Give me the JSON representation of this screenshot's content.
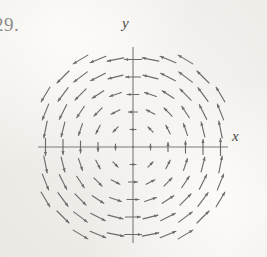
{
  "figure": {
    "problem_number": "29.",
    "axis_labels": {
      "x": "x",
      "y": "y"
    },
    "ink_color": "#6b6b6b",
    "axis_color": "#7a7a7a",
    "paper_color": "#fdfcfa"
  },
  "chart_data": {
    "type": "scatter",
    "subtype": "vector-field",
    "title": "",
    "xlabel": "x",
    "ylabel": "y",
    "xlim": [
      -5,
      5
    ],
    "ylim": [
      -5,
      5
    ],
    "grid": false,
    "legend": null,
    "axes_shown": [
      "x-axis",
      "y-axis"
    ],
    "field_description": "Counterclockwise rotational vector field; arrow length grows with distance from the origin; near the origin arrows shrink to dots.",
    "field_formula": "F(x, y) = <-y, x>",
    "grid_step": 1,
    "grid_x": [
      -5,
      -4,
      -3,
      -2,
      -1,
      0,
      1,
      2,
      3,
      4,
      5
    ],
    "grid_y": [
      -5,
      -4,
      -3,
      -2,
      -1,
      0,
      1,
      2,
      3,
      4,
      5
    ],
    "length_scale": 0.17,
    "max_length_px": 17,
    "origin_px": {
      "x": 133,
      "y": 147
    },
    "unit_px": 17.5,
    "omitted_corner_radius": 6.4,
    "sample_vectors": [
      {
        "x": 5,
        "y": 0,
        "u": 0,
        "v": 5
      },
      {
        "x": 0,
        "y": 5,
        "u": -5,
        "v": 0
      },
      {
        "x": -5,
        "y": 0,
        "u": 0,
        "v": -5
      },
      {
        "x": 0,
        "y": -5,
        "u": 5,
        "v": 0
      },
      {
        "x": 3,
        "y": 3,
        "u": -3,
        "v": 3
      },
      {
        "x": -3,
        "y": 3,
        "u": -3,
        "v": -3
      },
      {
        "x": -3,
        "y": -3,
        "u": 3,
        "v": -3
      },
      {
        "x": 3,
        "y": -3,
        "u": 3,
        "v": 3
      },
      {
        "x": 1,
        "y": 0,
        "u": 0,
        "v": 1
      },
      {
        "x": 0,
        "y": 1,
        "u": -1,
        "v": 0
      },
      {
        "x": -1,
        "y": 0,
        "u": 0,
        "v": -1
      },
      {
        "x": 0,
        "y": -1,
        "u": 1,
        "v": 0
      },
      {
        "x": 0,
        "y": 0,
        "u": 0,
        "v": 0
      }
    ]
  }
}
